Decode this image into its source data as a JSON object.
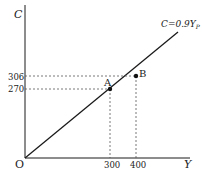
{
  "diagram": {
    "type": "consumption-function",
    "axes": {
      "y_label": "C",
      "x_label": "Y",
      "origin_label": "O"
    },
    "line": {
      "label_main": "C=0.9Y",
      "label_sub": "P",
      "slope": 0.9
    },
    "y_ticks": [
      "306",
      "270"
    ],
    "x_ticks": [
      "300",
      "400"
    ],
    "points": [
      {
        "label": "A",
        "x": 300,
        "y": 270
      },
      {
        "label": "B",
        "x": 400,
        "y": 306
      }
    ],
    "colors": {
      "line": "#1a1a1a",
      "dashed": "#555555",
      "text": "#222222"
    }
  }
}
